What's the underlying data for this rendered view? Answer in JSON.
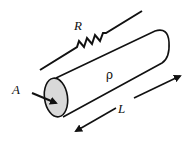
{
  "diagram": {
    "type": "resistance-of-conductor",
    "labels": {
      "resistor": "R",
      "resistivity": "ρ",
      "area": "A",
      "length": "L"
    },
    "colors": {
      "stroke": "#111111",
      "end_face_fill": "#d9d9d9",
      "background": "#ffffff"
    },
    "elements": [
      {
        "name": "resistor-symbol",
        "label": "R"
      },
      {
        "name": "cylinder-conductor",
        "label": "ρ"
      },
      {
        "name": "cross-section-arrow",
        "label": "A"
      },
      {
        "name": "length-arrow",
        "label": "L"
      }
    ]
  }
}
